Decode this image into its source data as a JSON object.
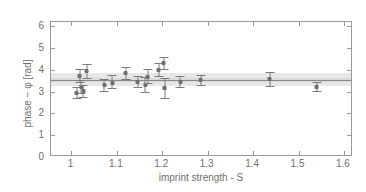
{
  "chart_data": {
    "type": "scatter",
    "title": "",
    "xlabel": "imprint strength - S",
    "ylabel": "phase − φ [rad]",
    "xlim": [
      0.955,
      1.62
    ],
    "ylim": [
      0,
      6.2
    ],
    "xticks": [
      1,
      1.1,
      1.2,
      1.3,
      1.4,
      1.5,
      1.6
    ],
    "xticklabels": [
      "1",
      "1.1",
      "1.2",
      "1.3",
      "1.4",
      "1.5",
      "1.6"
    ],
    "yticks": [
      0,
      1,
      2,
      3,
      4,
      5,
      6
    ],
    "yticklabels": [
      "0",
      "1",
      "2",
      "3",
      "4",
      "5",
      "6"
    ],
    "grid": false,
    "legend": null,
    "marker_color": "#6e6e6e",
    "errorbar_color": "#7b7b7b",
    "axis_color": "#9a9a9a",
    "band_color": "#e3e3e3",
    "band_inner_color": "#d6d6d6",
    "mean_line_color": "#8a8a8a",
    "reference": {
      "mean": 3.55,
      "band_low": 3.27,
      "band_high": 3.86,
      "inner_low": 3.43,
      "inner_high": 3.65,
      "label": "weighted mean with uncertainty band"
    },
    "series": [
      {
        "name": "phase measurements",
        "points": [
          {
            "x": 1.012,
            "y": 2.95,
            "yerr_low": 0.28,
            "yerr_high": 0.26
          },
          {
            "x": 1.018,
            "y": 3.72,
            "yerr_low": 0.34,
            "yerr_high": 0.33
          },
          {
            "x": 1.022,
            "y": 3.22,
            "yerr_low": 0.34,
            "yerr_high": 0.3
          },
          {
            "x": 1.026,
            "y": 3.02,
            "yerr_low": 0.31,
            "yerr_high": 0.3
          },
          {
            "x": 1.034,
            "y": 3.93,
            "yerr_low": 0.33,
            "yerr_high": 0.33
          },
          {
            "x": 1.072,
            "y": 3.3,
            "yerr_low": 0.3,
            "yerr_high": 0.29
          },
          {
            "x": 1.09,
            "y": 3.42,
            "yerr_low": 0.32,
            "yerr_high": 0.33
          },
          {
            "x": 1.12,
            "y": 3.85,
            "yerr_low": 0.3,
            "yerr_high": 0.29
          },
          {
            "x": 1.146,
            "y": 3.45,
            "yerr_low": 0.29,
            "yerr_high": 0.29
          },
          {
            "x": 1.163,
            "y": 3.32,
            "yerr_low": 0.37,
            "yerr_high": 0.35
          },
          {
            "x": 1.168,
            "y": 3.68,
            "yerr_low": 0.33,
            "yerr_high": 0.34
          },
          {
            "x": 1.192,
            "y": 4.01,
            "yerr_low": 0.33,
            "yerr_high": 0.33
          },
          {
            "x": 1.203,
            "y": 4.3,
            "yerr_low": 0.3,
            "yerr_high": 0.28
          },
          {
            "x": 1.206,
            "y": 3.16,
            "yerr_low": 0.5,
            "yerr_high": 0.49
          },
          {
            "x": 1.24,
            "y": 3.44,
            "yerr_low": 0.27,
            "yerr_high": 0.28
          },
          {
            "x": 1.285,
            "y": 3.52,
            "yerr_low": 0.24,
            "yerr_high": 0.23
          },
          {
            "x": 1.437,
            "y": 3.56,
            "yerr_low": 0.35,
            "yerr_high": 0.33
          },
          {
            "x": 1.54,
            "y": 3.22,
            "yerr_low": 0.23,
            "yerr_high": 0.22
          }
        ]
      }
    ]
  }
}
